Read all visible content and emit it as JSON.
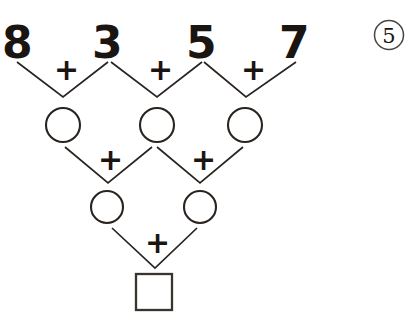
{
  "exercise": {
    "badge": {
      "number": "5",
      "shape": "circle-outline",
      "icon_name": "exercise-number-badge"
    },
    "operator_symbol": "+",
    "structure": "addition-pyramid",
    "rows": [
      {
        "row_index": 0,
        "type": "given-numbers",
        "cells": [
          {
            "id": "r0c0",
            "value": "8",
            "filled": true
          },
          {
            "id": "r0c1",
            "value": "3",
            "filled": true
          },
          {
            "id": "r0c2",
            "value": "5",
            "filled": true
          },
          {
            "id": "r0c3",
            "value": "7",
            "filled": true
          }
        ],
        "operators": [
          "+",
          "+",
          "+"
        ]
      },
      {
        "row_index": 1,
        "type": "blank-circles",
        "cells": [
          {
            "id": "r1c0",
            "value": "",
            "filled": false
          },
          {
            "id": "r1c1",
            "value": "",
            "filled": false
          },
          {
            "id": "r1c2",
            "value": "",
            "filled": false
          }
        ],
        "operators": [
          "+",
          "+"
        ]
      },
      {
        "row_index": 2,
        "type": "blank-circles",
        "cells": [
          {
            "id": "r2c0",
            "value": "",
            "filled": false
          },
          {
            "id": "r2c1",
            "value": "",
            "filled": false
          }
        ],
        "operators": [
          "+"
        ]
      },
      {
        "row_index": 3,
        "type": "blank-square",
        "cells": [
          {
            "id": "r3c0",
            "value": "",
            "filled": false
          }
        ],
        "operators": []
      }
    ]
  }
}
